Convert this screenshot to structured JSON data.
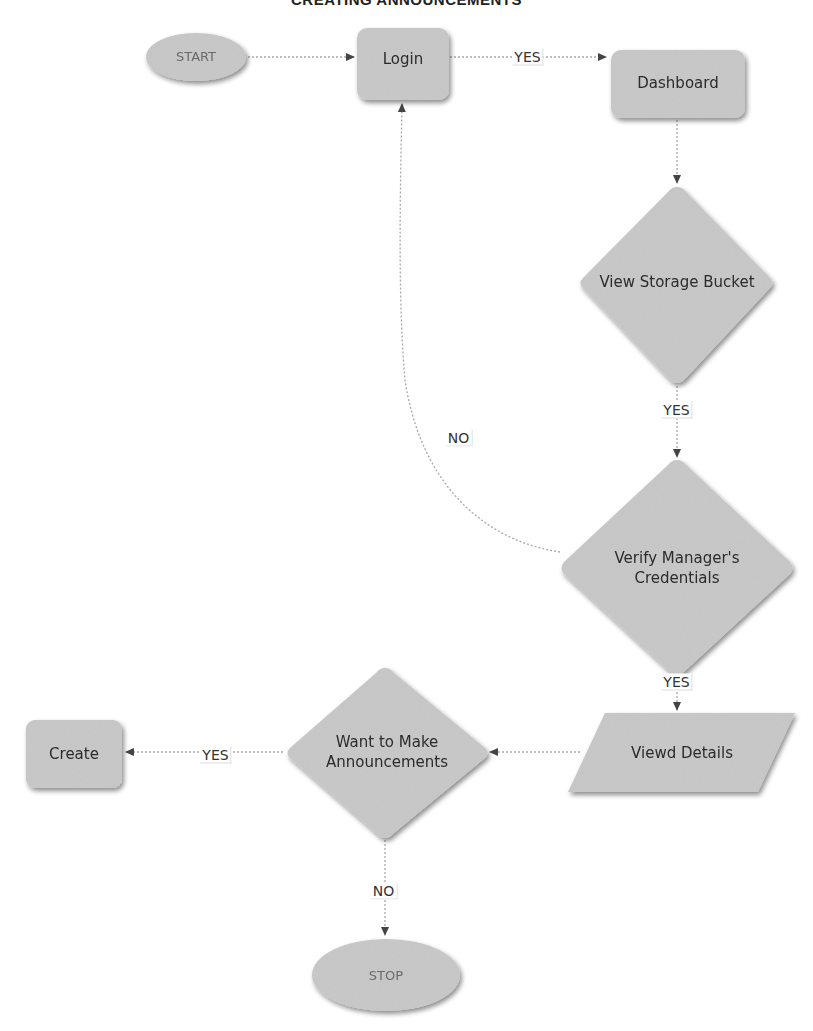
{
  "title": "CREATING ANNOUNCEMENTS",
  "colors": {
    "node_fill": "#c9c9c9",
    "node_shadow": "#9a9a9a",
    "edge": "#a8a8a8",
    "arrow": "#444444",
    "text": "#2b2b2b",
    "terminal_text": "#6a6a6a"
  },
  "nodes": {
    "start": {
      "label": "START",
      "shape": "ellipse"
    },
    "login": {
      "label": "Login",
      "shape": "rounded-rect"
    },
    "dashboard": {
      "label": "Dashboard",
      "shape": "rounded-rect"
    },
    "view_storage": {
      "label": "View Storage Bucket",
      "shape": "diamond"
    },
    "verify_line1": {
      "label": "Verify Manager's",
      "shape": "diamond"
    },
    "verify_line2": {
      "label": "Credentials"
    },
    "viewed_details": {
      "label": "Viewd Details",
      "shape": "parallelogram"
    },
    "want_line1": {
      "label": "Want to Make",
      "shape": "diamond"
    },
    "want_line2": {
      "label": "Announcements"
    },
    "create": {
      "label": "Create",
      "shape": "rounded-rect"
    },
    "stop": {
      "label": "STOP",
      "shape": "ellipse"
    }
  },
  "edges": [
    {
      "from": "START",
      "to": "Login",
      "label": ""
    },
    {
      "from": "Login",
      "to": "Dashboard",
      "label": "YES"
    },
    {
      "from": "Dashboard",
      "to": "View Storage Bucket",
      "label": ""
    },
    {
      "from": "View Storage Bucket",
      "to": "Verify Manager's Credentials",
      "label": "YES"
    },
    {
      "from": "Verify Manager's Credentials",
      "to": "Login",
      "label": "NO"
    },
    {
      "from": "Verify Manager's Credentials",
      "to": "Viewd Details",
      "label": "YES"
    },
    {
      "from": "Viewd Details",
      "to": "Want to Make Announcements",
      "label": ""
    },
    {
      "from": "Want to Make Announcements",
      "to": "Create",
      "label": "YES"
    },
    {
      "from": "Want to Make Announcements",
      "to": "STOP",
      "label": "NO"
    }
  ],
  "edge_labels": {
    "login_dashboard": "YES",
    "storage_verify": "YES",
    "verify_login": "NO",
    "verify_details": "YES",
    "want_create": "YES",
    "want_stop": "NO"
  }
}
